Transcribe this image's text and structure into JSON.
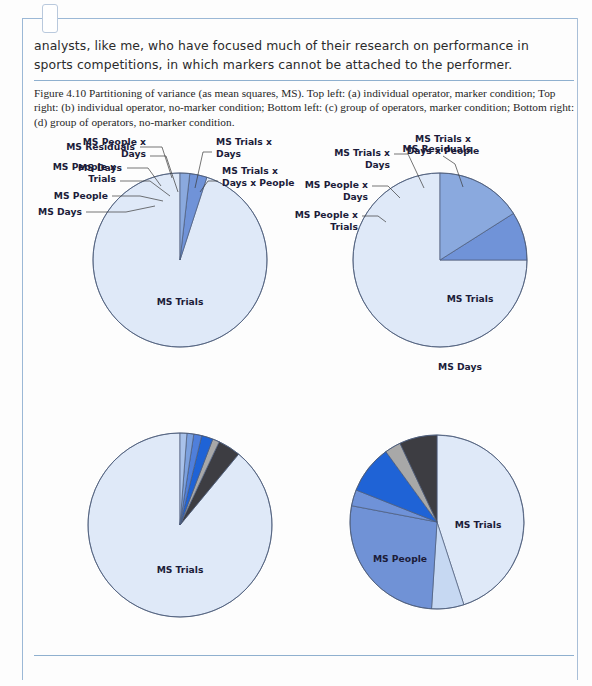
{
  "document": {
    "body_paragraph": "analysts, like me, who have focused much of their research on performance in sports competitions, in which markers cannot be attached to the performer.",
    "caption": "Figure 4.10  Partitioning of variance (as mean squares, MS). Top left: (a) individual operator, marker condition; Top right: (b) individual operator, no-marker condition; Bottom left: (c) group of operators, marker condition; Bottom right: (d) group of operators, no-marker condition."
  },
  "colors": {
    "ms_trials": "#dfe9f8",
    "ms_days_light": "#c6d8f2",
    "ms_days_mid": "#8aa9de",
    "ms_residuals": "#7093d8",
    "ms_people": "#7092d6",
    "ms_people_x_trials": "#6f92d8",
    "ms_people_x_days": "#1f63d6",
    "ms_trials_x_days": "#a8a8a8",
    "ms_trials_x_days_x_people": "#3d3d42",
    "outline": "#4a5a78",
    "frame": "#9bb8d6",
    "rule": "#8fb0cf",
    "text": "#2b2b2b"
  },
  "chart_data": [
    {
      "type": "pie",
      "id": "a",
      "title": "(a) individual operator, marker condition",
      "position": "top-left",
      "start_angle_deg": 0,
      "direction": "counterclockwise",
      "labels": [
        "MS Trials",
        "MS Residuals",
        "MS Days"
      ],
      "values": [
        95.0,
        3.2,
        1.8
      ],
      "colors": [
        "#dfe9f8",
        "#7093d8",
        "#8aa9de"
      ],
      "label_placement": [
        "inside",
        "callout",
        "callout"
      ]
    },
    {
      "type": "pie",
      "id": "b",
      "title": "(b) individual operator, no-marker condition",
      "position": "top-right",
      "start_angle_deg": 0,
      "direction": "counterclockwise",
      "labels": [
        "MS Trials",
        "MS Residuals",
        "MS Days"
      ],
      "values": [
        75.0,
        9.0,
        16.0
      ],
      "colors": [
        "#dfe9f8",
        "#7093d8",
        "#8aa9de"
      ],
      "label_placement": [
        "inside",
        "callout",
        "inside"
      ]
    },
    {
      "type": "pie",
      "id": "c",
      "title": "(c) group of operators, marker condition",
      "position": "bottom-left",
      "start_angle_deg": 0,
      "direction": "counterclockwise",
      "labels": [
        "MS Trials",
        "MS Trials x Days x People",
        "MS Trials x Days",
        "MS People x Days",
        "MS People x Trials",
        "MS People",
        "MS Days"
      ],
      "values": [
        89.0,
        4.0,
        1.2,
        2.0,
        1.4,
        1.2,
        1.2
      ],
      "colors": [
        "#dfe9f8",
        "#3d3d42",
        "#a8a8a8",
        "#1f63d6",
        "#4f7fdb",
        "#7ba0de",
        "#a9c2ea"
      ],
      "label_placement": [
        "inside",
        "callout",
        "callout",
        "callout",
        "callout",
        "callout",
        "callout"
      ]
    },
    {
      "type": "pie",
      "id": "d",
      "title": "(d) group of operators, no-marker condition",
      "position": "bottom-right",
      "start_angle_deg": 0,
      "direction": "clockwise",
      "labels": [
        "MS Trials",
        "MS Days",
        "MS People",
        "MS People x Trials",
        "MS People x Days",
        "MS Trials x Days",
        "MS Trials x Days x People"
      ],
      "values": [
        45.0,
        6.0,
        27.0,
        3.0,
        9.0,
        3.0,
        7.0
      ],
      "colors": [
        "#dfe9f8",
        "#c6d8f2",
        "#7092d6",
        "#6f92d8",
        "#1f63d6",
        "#a8a8a8",
        "#3d3d42"
      ],
      "label_placement": [
        "inside",
        "callout",
        "inside",
        "callout",
        "callout",
        "callout",
        "callout"
      ]
    }
  ],
  "chart_layout": {
    "a": {
      "cx": 180,
      "cy": 130,
      "r": 87
    },
    "b": {
      "cx": 440,
      "cy": 130,
      "r": 87
    },
    "c": {
      "cx": 180,
      "cy": 395,
      "r": 92
    },
    "d": {
      "cx": 437,
      "cy": 392,
      "r": 87
    }
  },
  "callouts": {
    "a": [
      {
        "label": "MS Residuals",
        "lines": [
          "MS Residuals"
        ],
        "tx": 135,
        "ty": 20,
        "anchor": "end",
        "elbow": [
          140,
          17,
          162,
          17,
          172,
          48
        ]
      },
      {
        "label": "MS Days",
        "lines": [
          "MS Days"
        ],
        "tx": 122,
        "ty": 41,
        "anchor": "end",
        "elbow": [
          127,
          38,
          148,
          38,
          161,
          56
        ]
      }
    ],
    "b": [
      {
        "label": "MS Residuals",
        "lines": [
          "MS Residuals"
        ],
        "tx": 437,
        "ty": 22,
        "anchor": "middle",
        "elbow": null
      }
    ],
    "c": [
      {
        "label": "MS People x Days",
        "lines": [
          "MS People x",
          "Days"
        ],
        "tx": 146,
        "ty": 15,
        "anchor": "end",
        "elbow": [
          150,
          26,
          166,
          26,
          178,
          62
        ]
      },
      {
        "label": "MS People x Trials",
        "lines": [
          "MS People x",
          "Trials"
        ],
        "tx": 116,
        "ty": 40,
        "anchor": "end",
        "elbow": [
          120,
          51,
          150,
          51,
          170,
          66
        ]
      },
      {
        "label": "MS People",
        "lines": [
          "MS People"
        ],
        "tx": 108,
        "ty": 69,
        "anchor": "end",
        "elbow": [
          112,
          66,
          140,
          66,
          163,
          71
        ]
      },
      {
        "label": "MS Days",
        "lines": [
          "MS Days"
        ],
        "tx": 82,
        "ty": 85,
        "anchor": "end",
        "elbow": [
          86,
          82,
          126,
          82,
          155,
          76
        ]
      },
      {
        "label": "MS Trials x Days",
        "lines": [
          "MS Trials x",
          "Days"
        ],
        "tx": 216,
        "ty": 15,
        "anchor": "start",
        "elbow": [
          212,
          22,
          203,
          22,
          195,
          58
        ]
      },
      {
        "label": "MS Trials x Days x People",
        "lines": [
          "MS Trials x",
          "Days x People"
        ],
        "tx": 222,
        "ty": 44,
        "anchor": "start",
        "elbow": [
          218,
          51,
          208,
          51,
          200,
          62
        ]
      }
    ],
    "d": [
      {
        "label": "MS Trials x Days x People",
        "lines": [
          "MS Trials x",
          "Days x People"
        ],
        "tx": 443,
        "ty": 12,
        "anchor": "middle",
        "elbow": [
          443,
          26,
          455,
          34,
          463,
          57
        ]
      },
      {
        "label": "MS Trials x Days",
        "lines": [
          "MS Trials x",
          "Days"
        ],
        "tx": 390,
        "ty": 26,
        "anchor": "end",
        "elbow": [
          394,
          24,
          408,
          24,
          424,
          58
        ]
      },
      {
        "label": "MS People x Days",
        "lines": [
          "MS People x",
          "Days"
        ],
        "tx": 368,
        "ty": 58,
        "anchor": "end",
        "elbow": [
          372,
          56,
          388,
          56,
          400,
          68
        ]
      },
      {
        "label": "MS People x Trials",
        "lines": [
          "MS People x",
          "Trials"
        ],
        "tx": 358,
        "ty": 88,
        "anchor": "end",
        "elbow": [
          362,
          86,
          378,
          86,
          386,
          92
        ]
      },
      {
        "label": "MS Days",
        "lines": [
          "MS Days"
        ],
        "tx": 460,
        "ty": 240,
        "anchor": "middle",
        "elbow": null
      }
    ]
  },
  "inside_labels": {
    "a": [
      {
        "label": "MS Trials",
        "x": 180,
        "y": 175
      }
    ],
    "b": [
      {
        "label": "MS Trials",
        "x": 470,
        "y": 172
      }
    ],
    "c": [
      {
        "label": "MS Trials",
        "x": 180,
        "y": 443
      }
    ],
    "d": [
      {
        "label": "MS Trials",
        "x": 478,
        "y": 398
      },
      {
        "label": "MS People",
        "x": 400,
        "y": 432
      }
    ]
  }
}
